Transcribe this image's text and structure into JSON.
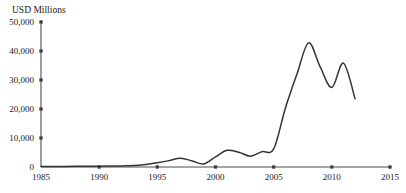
{
  "figure": {
    "width": 406,
    "height": 193,
    "background": "#ffffff"
  },
  "chart_data": {
    "type": "line",
    "title": "",
    "subtitle": "",
    "xlabel": "",
    "ylabel": "USD Millions",
    "xlim": [
      1985,
      2015
    ],
    "ylim": [
      0,
      50000
    ],
    "grid": false,
    "legend": null,
    "legend_position": "none",
    "line_color": "#333333",
    "axis_color": "#4d4d4d",
    "x_ticks": [
      1985,
      1990,
      1995,
      2000,
      2005,
      2010,
      2015
    ],
    "x_tick_labels": [
      "1985",
      "1990",
      "1995",
      "2000",
      "2005",
      "2010",
      "2015"
    ],
    "y_ticks": [
      0,
      10000,
      20000,
      30000,
      40000,
      50000
    ],
    "y_tick_labels": [
      "0",
      "10,000",
      "20,000",
      "30,000",
      "40,000",
      "50,000"
    ],
    "series": [
      {
        "name": "USD Millions",
        "x": [
          1985,
          1986,
          1987,
          1988,
          1989,
          1990,
          1991,
          1992,
          1993,
          1994,
          1995,
          1996,
          1997,
          1998,
          1999,
          2000,
          2001,
          2002,
          2003,
          2004,
          2005,
          2006,
          2007,
          2008,
          2009,
          2010,
          2011,
          2012
        ],
        "values": [
          150,
          170,
          200,
          230,
          260,
          300,
          330,
          380,
          500,
          900,
          1500,
          2200,
          3050,
          2100,
          1050,
          3500,
          5750,
          5100,
          3750,
          5300,
          6250,
          20200,
          32000,
          42800,
          34500,
          27400,
          35800,
          23500
        ]
      }
    ],
    "annotations": []
  },
  "axis_title": {
    "text": "USD Millions"
  }
}
